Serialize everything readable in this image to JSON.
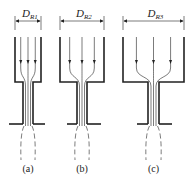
{
  "figure": {
    "panels": [
      {
        "id": "a",
        "dimension_label": "D",
        "dimension_subscript": "R1",
        "caption": "(a)",
        "box": {
          "left": 15,
          "right": 41,
          "top": 37,
          "bottom": 82
        },
        "neck": {
          "left": 23,
          "right": 33
        },
        "base": {
          "left": 9,
          "right": 45
        },
        "flow_lines": 3
      },
      {
        "id": "b",
        "dimension_label": "D",
        "dimension_subscript": "R2",
        "caption": "(b)",
        "box": {
          "left": 60,
          "right": 104,
          "top": 37,
          "bottom": 82
        },
        "neck": {
          "left": 77,
          "right": 87
        },
        "base": {
          "left": 67,
          "right": 101
        },
        "flow_lines": 3
      },
      {
        "id": "c",
        "dimension_label": "D",
        "dimension_subscript": "R3",
        "caption": "(c)",
        "box": {
          "left": 123,
          "right": 184,
          "top": 37,
          "bottom": 82
        },
        "neck": {
          "left": 148,
          "right": 159
        },
        "base": {
          "left": 137,
          "right": 172
        },
        "flow_lines": 3
      }
    ],
    "colors": {
      "stroke": "#222222",
      "background": "#ffffff"
    }
  }
}
